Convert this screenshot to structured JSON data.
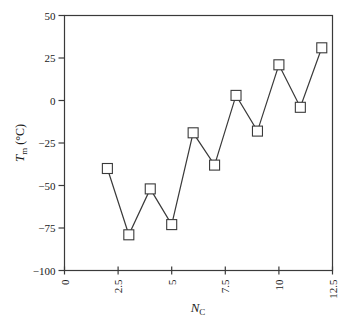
{
  "chart_data": {
    "type": "line",
    "title": "",
    "xlabel": "N_C",
    "xlabel_main": "N",
    "xlabel_sub": "C",
    "ylabel": "T_m (°C)",
    "ylabel_main": "T",
    "ylabel_sub": "m",
    "ylabel_unit": " (°C)",
    "xlim": [
      0,
      12.5
    ],
    "ylim": [
      -100,
      50
    ],
    "x_ticks": [
      0,
      2.5,
      5,
      7.5,
      10,
      12.5
    ],
    "x_tick_labels": [
      "0",
      "2.5",
      "5",
      "7.5",
      "10",
      "12.5"
    ],
    "y_ticks": [
      50,
      25,
      0,
      -25,
      -50,
      -75,
      -100
    ],
    "y_tick_labels": [
      "50",
      "25",
      "0",
      "−25",
      "−50",
      "−75",
      "−100"
    ],
    "grid": false,
    "legend": null,
    "marker": "open-square",
    "series": [
      {
        "name": "Tm",
        "x": [
          2,
          3,
          4,
          5,
          6,
          7,
          8,
          9,
          10,
          11,
          12
        ],
        "values": [
          -40,
          -79,
          -52,
          -73,
          -19,
          -38,
          3,
          -18,
          21,
          -4,
          31
        ]
      }
    ]
  },
  "colors": {
    "line": "#3a3a3a",
    "axis": "#3a3a3a",
    "marker_fill": "#ffffff",
    "marker_stroke": "#3a3a3a"
  }
}
